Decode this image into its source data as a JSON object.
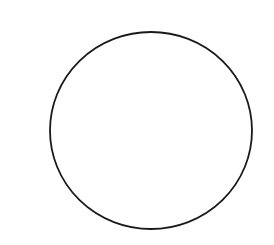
{
  "canvas": {
    "width": 274,
    "height": 245,
    "background": "#ffffff"
  },
  "shapes": [
    {
      "type": "ellipse",
      "name": "circle-outline",
      "cx": 151,
      "cy": 130.5,
      "rx": 101,
      "ry": 98.5,
      "stroke": "#1a1a1a",
      "stroke_width": 1.8,
      "fill": "none"
    }
  ]
}
